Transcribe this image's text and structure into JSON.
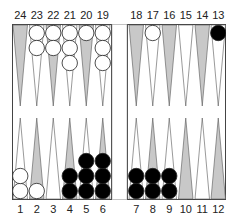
{
  "top_labels": [
    "24",
    "23",
    "22",
    "21",
    "20",
    "19",
    "18",
    "17",
    "16",
    "15",
    "14",
    "13"
  ],
  "bottom_labels": [
    "1",
    "2",
    "3",
    "4",
    "5",
    "6",
    "7",
    "8",
    "9",
    "10",
    "11",
    "12"
  ],
  "colors": {
    "light_point": "#ffffff",
    "dark_point": "#c8c8c8",
    "white_checker": "#ffffff",
    "black_checker": "#000000",
    "line": "#555555"
  },
  "checkers": {
    "24": {
      "color": "",
      "count": 0
    },
    "23": {
      "color": "white",
      "count": 2
    },
    "22": {
      "color": "white",
      "count": 2
    },
    "21": {
      "color": "white",
      "count": 3
    },
    "20": {
      "color": "white",
      "count": 1
    },
    "19": {
      "color": "white",
      "count": 3
    },
    "18": {
      "color": "",
      "count": 0
    },
    "17": {
      "color": "white",
      "count": 1
    },
    "16": {
      "color": "",
      "count": 0
    },
    "15": {
      "color": "",
      "count": 0
    },
    "14": {
      "color": "",
      "count": 0
    },
    "13": {
      "color": "black",
      "count": 1
    },
    "1": {
      "color": "white",
      "count": 2
    },
    "2": {
      "color": "white",
      "count": 1
    },
    "3": {
      "color": "",
      "count": 0
    },
    "4": {
      "color": "black",
      "count": 2
    },
    "5": {
      "color": "black",
      "count": 3
    },
    "6": {
      "color": "black",
      "count": 3
    },
    "7": {
      "color": "black",
      "count": 2
    },
    "8": {
      "color": "black",
      "count": 2
    },
    "9": {
      "color": "black",
      "count": 2
    },
    "10": {
      "color": "",
      "count": 0
    },
    "11": {
      "color": "",
      "count": 0
    },
    "12": {
      "color": "",
      "count": 0
    }
  }
}
